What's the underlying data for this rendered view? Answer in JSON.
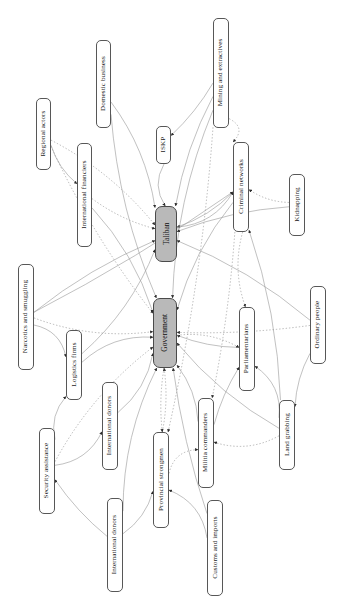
{
  "figure": {
    "type": "network-diagram",
    "orientation": "rotated-90",
    "background_color": "#ffffff",
    "hub_fill_color": "#b9b9b9",
    "node_fill_color": "#ffffff",
    "node_border_color": "#575757",
    "edge_color_solid": "#9a9a9a",
    "edge_color_dotted": "#8d8d8d"
  },
  "nodes": [
    {
      "id": "regional_actors",
      "label": "Regional actors",
      "x": 36,
      "y": 98,
      "w": 15,
      "h": 72,
      "hub": false
    },
    {
      "id": "domestic_business",
      "label": "Domestic business",
      "x": 96,
      "y": 40,
      "w": 15,
      "h": 88,
      "hub": false
    },
    {
      "id": "mining_extractives",
      "label": "Mining and extractives",
      "x": 213,
      "y": 18,
      "w": 16,
      "h": 110,
      "hub": false
    },
    {
      "id": "international_financiers",
      "label": "International financiers",
      "x": 77,
      "y": 143,
      "w": 15,
      "h": 104,
      "hub": false
    },
    {
      "id": "iskp",
      "label": "ISKP",
      "x": 156,
      "y": 126,
      "w": 15,
      "h": 38,
      "hub": false
    },
    {
      "id": "criminal_networks",
      "label": "Criminal networks",
      "x": 233,
      "y": 142,
      "w": 16,
      "h": 90,
      "hub": false
    },
    {
      "id": "kidnapping",
      "label": "Kidnapping",
      "x": 289,
      "y": 174,
      "w": 16,
      "h": 62,
      "hub": false
    },
    {
      "id": "taliban",
      "label": "Taliban",
      "x": 155,
      "y": 206,
      "w": 22,
      "h": 56,
      "hub": true
    },
    {
      "id": "narcotics_smuggling",
      "label": "Narcotics and smuggling",
      "x": 18,
      "y": 264,
      "w": 16,
      "h": 106,
      "hub": false
    },
    {
      "id": "government",
      "label": "Government",
      "x": 153,
      "y": 298,
      "w": 24,
      "h": 70,
      "hub": true
    },
    {
      "id": "parliamentarians",
      "label": "Parliamentarians",
      "x": 239,
      "y": 307,
      "w": 16,
      "h": 84,
      "hub": false
    },
    {
      "id": "ordinary_people",
      "label": "Ordinary people",
      "x": 310,
      "y": 286,
      "w": 16,
      "h": 78,
      "hub": false
    },
    {
      "id": "logistics_firms",
      "label": "Logistics firms",
      "x": 66,
      "y": 330,
      "w": 16,
      "h": 70,
      "hub": false
    },
    {
      "id": "international_donors_1",
      "label": "International donors",
      "x": 102,
      "y": 382,
      "w": 16,
      "h": 88,
      "hub": false
    },
    {
      "id": "militia_commanders",
      "label": "Militia commanders",
      "x": 198,
      "y": 398,
      "w": 16,
      "h": 90,
      "hub": false
    },
    {
      "id": "land_grabbing",
      "label": "Land grabbing",
      "x": 279,
      "y": 400,
      "w": 16,
      "h": 70,
      "hub": false
    },
    {
      "id": "security_assistance",
      "label": "Security assistance",
      "x": 39,
      "y": 428,
      "w": 16,
      "h": 86,
      "hub": false
    },
    {
      "id": "provincial_strongmen",
      "label": "Provincial strongmen",
      "x": 153,
      "y": 432,
      "w": 16,
      "h": 96,
      "hub": false
    },
    {
      "id": "international_donors_2",
      "label": "International donors",
      "x": 107,
      "y": 498,
      "w": 16,
      "h": 94,
      "hub": false
    },
    {
      "id": "customs_imports",
      "label": "Customs and imports",
      "x": 207,
      "y": 500,
      "w": 16,
      "h": 96,
      "hub": false
    }
  ],
  "edges": [
    {
      "from": "regional_actors",
      "to": "international_financiers",
      "style": "solid"
    },
    {
      "from": "regional_actors",
      "to": "taliban",
      "style": "dotted"
    },
    {
      "from": "regional_actors",
      "to": "government",
      "style": "dotted"
    },
    {
      "from": "domestic_business",
      "to": "taliban",
      "style": "solid"
    },
    {
      "from": "domestic_business",
      "to": "government",
      "style": "solid"
    },
    {
      "from": "mining_extractives",
      "to": "iskp",
      "style": "solid"
    },
    {
      "from": "mining_extractives",
      "to": "taliban",
      "style": "solid"
    },
    {
      "from": "mining_extractives",
      "to": "criminal_networks",
      "style": "dotted"
    },
    {
      "from": "mining_extractives",
      "to": "government",
      "style": "solid"
    },
    {
      "from": "mining_extractives",
      "to": "provincial_strongmen",
      "style": "dotted"
    },
    {
      "from": "international_financiers",
      "to": "taliban",
      "style": "dotted"
    },
    {
      "from": "international_financiers",
      "to": "government",
      "style": "solid"
    },
    {
      "from": "iskp",
      "to": "taliban",
      "style": "solid"
    },
    {
      "from": "criminal_networks",
      "to": "taliban",
      "style": "solid"
    },
    {
      "from": "criminal_networks",
      "to": "government",
      "style": "solid"
    },
    {
      "from": "criminal_networks",
      "to": "militia_commanders",
      "style": "dotted"
    },
    {
      "from": "criminal_networks",
      "to": "parliamentarians",
      "style": "dotted"
    },
    {
      "from": "kidnapping",
      "to": "criminal_networks",
      "style": "dotted"
    },
    {
      "from": "kidnapping",
      "to": "taliban",
      "style": "solid"
    },
    {
      "from": "narcotics_smuggling",
      "to": "taliban",
      "style": "solid"
    },
    {
      "from": "narcotics_smuggling",
      "to": "government",
      "style": "dotted"
    },
    {
      "from": "narcotics_smuggling",
      "to": "logistics_firms",
      "style": "solid"
    },
    {
      "from": "narcotics_smuggling",
      "to": "criminal_networks",
      "style": "solid"
    },
    {
      "from": "logistics_firms",
      "to": "government",
      "style": "solid"
    },
    {
      "from": "logistics_firms",
      "to": "taliban",
      "style": "solid"
    },
    {
      "from": "security_assistance",
      "to": "logistics_firms",
      "style": "solid"
    },
    {
      "from": "security_assistance",
      "to": "international_donors_1",
      "style": "solid"
    },
    {
      "from": "security_assistance",
      "to": "government",
      "style": "dotted"
    },
    {
      "from": "international_donors_1",
      "to": "government",
      "style": "solid"
    },
    {
      "from": "international_donors_2",
      "to": "security_assistance",
      "style": "solid"
    },
    {
      "from": "international_donors_2",
      "to": "provincial_strongmen",
      "style": "solid"
    },
    {
      "from": "international_donors_2",
      "to": "government",
      "style": "solid"
    },
    {
      "from": "provincial_strongmen",
      "to": "government",
      "style": "dotted"
    },
    {
      "from": "provincial_strongmen",
      "to": "militia_commanders",
      "style": "dotted"
    },
    {
      "from": "customs_imports",
      "to": "provincial_strongmen",
      "style": "solid"
    },
    {
      "from": "customs_imports",
      "to": "government",
      "style": "solid"
    },
    {
      "from": "militia_commanders",
      "to": "government",
      "style": "solid"
    },
    {
      "from": "militia_commanders",
      "to": "parliamentarians",
      "style": "solid"
    },
    {
      "from": "land_grabbing",
      "to": "parliamentarians",
      "style": "solid"
    },
    {
      "from": "land_grabbing",
      "to": "militia_commanders",
      "style": "dotted"
    },
    {
      "from": "land_grabbing",
      "to": "criminal_networks",
      "style": "solid"
    },
    {
      "from": "land_grabbing",
      "to": "government",
      "style": "solid"
    },
    {
      "from": "ordinary_people",
      "to": "land_grabbing",
      "style": "solid"
    },
    {
      "from": "ordinary_people",
      "to": "government",
      "style": "dotted"
    },
    {
      "from": "ordinary_people",
      "to": "taliban",
      "style": "solid"
    },
    {
      "from": "parliamentarians",
      "to": "government",
      "style": "solid"
    },
    {
      "from": "taliban",
      "to": "criminal_networks",
      "style": "solid"
    },
    {
      "from": "government",
      "to": "parliamentarians",
      "style": "dotted"
    },
    {
      "from": "government",
      "to": "provincial_strongmen",
      "style": "dotted"
    }
  ]
}
